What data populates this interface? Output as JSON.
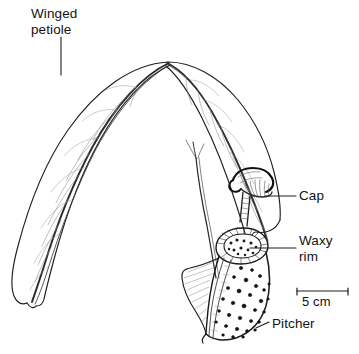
{
  "figure": {
    "background_color": "#ffffff",
    "ink_color": "#1a1a1a",
    "width": 359,
    "height": 354
  },
  "labels": {
    "winged_petiole": "Winged\npetiole",
    "cap": "Cap",
    "waxy_rim": "Waxy\nrim",
    "pitcher": "Pitcher"
  },
  "scale_bar": {
    "text": "5 cm",
    "length_px": 51
  }
}
